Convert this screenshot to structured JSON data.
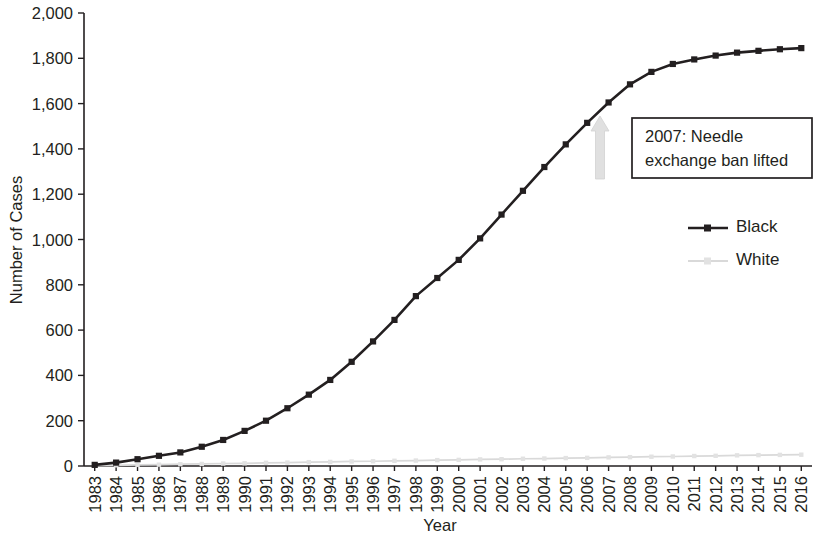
{
  "chart_data": {
    "type": "line",
    "title": "",
    "xlabel": "Year",
    "ylabel": "Number of Cases",
    "ylim": [
      0,
      2000
    ],
    "ytick_values": [
      0,
      200,
      400,
      600,
      800,
      1000,
      1200,
      1400,
      1600,
      1800,
      2000
    ],
    "ytick_labels": [
      "0",
      "200",
      "400",
      "600",
      "800",
      "1,000",
      "1,200",
      "1,400",
      "1,600",
      "1,800",
      "2,000"
    ],
    "grid": false,
    "legend_position": "right",
    "categories": [
      "1983",
      "1984",
      "1985",
      "1986",
      "1987",
      "1988",
      "1989",
      "1990",
      "1991",
      "1992",
      "1993",
      "1994",
      "1995",
      "1996",
      "1997",
      "1998",
      "1999",
      "2000",
      "2001",
      "2002",
      "2003",
      "2004",
      "2005",
      "2006",
      "2007",
      "2008",
      "2009",
      "2010",
      "2011",
      "2012",
      "2013",
      "2014",
      "2015",
      "2016"
    ],
    "series": [
      {
        "name": "Black",
        "color": "#231f20",
        "values": [
          5,
          15,
          30,
          45,
          60,
          85,
          115,
          155,
          200,
          255,
          315,
          380,
          460,
          550,
          645,
          750,
          830,
          910,
          1005,
          1110,
          1215,
          1320,
          1420,
          1515,
          1605,
          1685,
          1740,
          1775,
          1795,
          1812,
          1825,
          1833,
          1840,
          1845
        ]
      },
      {
        "name": "White",
        "color": "#d9d9d9",
        "values": [
          2,
          3,
          5,
          6,
          8,
          9,
          11,
          12,
          14,
          15,
          17,
          18,
          20,
          21,
          23,
          24,
          26,
          27,
          29,
          30,
          32,
          33,
          35,
          36,
          38,
          39,
          41,
          42,
          44,
          45,
          47,
          48,
          49,
          50
        ]
      }
    ],
    "annotations": [
      {
        "id": "needle-exchange",
        "text_lines": [
          "2007: Needle",
          "exchange ban lifted"
        ],
        "at_category": "2007",
        "arrow": "up-arrow"
      }
    ]
  },
  "legend": {
    "items": [
      {
        "label": "Black",
        "color": "#231f20"
      },
      {
        "label": "White",
        "color": "#d9d9d9"
      }
    ]
  },
  "axes": {
    "x_title": "Year",
    "y_title": "Number of Cases"
  }
}
